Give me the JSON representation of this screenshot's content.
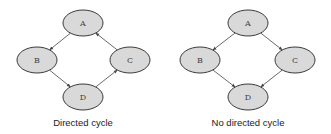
{
  "diagrams": [
    {
      "caption": "Directed cycle",
      "nodes": [
        {
          "id": "A",
          "label": "A",
          "cx": 83,
          "cy": 23
        },
        {
          "id": "B",
          "label": "B",
          "cx": 37,
          "cy": 60
        },
        {
          "id": "C",
          "label": "C",
          "cx": 130,
          "cy": 60
        },
        {
          "id": "D",
          "label": "D",
          "cx": 83,
          "cy": 97
        }
      ],
      "edges": [
        {
          "from": "A",
          "to": "B"
        },
        {
          "from": "B",
          "to": "D"
        },
        {
          "from": "D",
          "to": "C"
        },
        {
          "from": "C",
          "to": "A"
        }
      ]
    },
    {
      "caption": "No directed cycle",
      "nodes": [
        {
          "id": "A",
          "label": "A",
          "cx": 248,
          "cy": 23
        },
        {
          "id": "B",
          "label": "B",
          "cx": 200,
          "cy": 60
        },
        {
          "id": "C",
          "label": "C",
          "cx": 295,
          "cy": 60
        },
        {
          "id": "D",
          "label": "D",
          "cx": 248,
          "cy": 97
        }
      ],
      "edges": [
        {
          "from": "A",
          "to": "B"
        },
        {
          "from": "A",
          "to": "C"
        },
        {
          "from": "B",
          "to": "D"
        },
        {
          "from": "C",
          "to": "D"
        }
      ]
    }
  ],
  "style": {
    "node_fill": "#d9d9d9",
    "node_stroke": "#3a3a3a",
    "edge_color": "#444444",
    "node_rx": 20,
    "node_ry": 13
  }
}
